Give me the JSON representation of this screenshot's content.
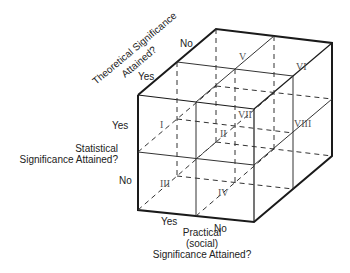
{
  "diagram": {
    "type": "3D cube (2x2x2 classification)",
    "axes": {
      "theoretical": {
        "title_line1": "Theoretical Significance",
        "title_line2": "Attained?",
        "yes": "Yes",
        "no": "No"
      },
      "statistical": {
        "title_line1": "Statistical",
        "title_line2": "Significance Attained?",
        "yes": "Yes",
        "no": "No"
      },
      "practical": {
        "title_line1": "Practical",
        "title_line2": "(social)",
        "title_line3": "Significance Attained?",
        "yes": "Yes",
        "no": "No"
      }
    },
    "cells": {
      "c1": "I",
      "c2": "II",
      "c3": "III",
      "c4": "IV",
      "c5": "V",
      "c6": "VI",
      "c7": "VII",
      "c8": "VIII"
    },
    "colors": {
      "line": "#1a1a1a",
      "thin_line": "#444444"
    }
  }
}
